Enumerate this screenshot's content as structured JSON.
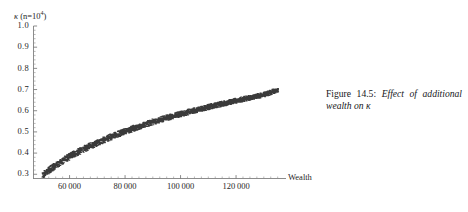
{
  "figure": {
    "caption_lead": "Figure 14.5:",
    "caption_body": "Effect of additional wealth on",
    "caption_symbol": "κ"
  },
  "axes": {
    "ylabel_symbol": "κ",
    "ylabel_prefix": " (n=10",
    "ylabel_exponent": "4",
    "ylabel_suffix": ")",
    "xlabel": "Wealth"
  },
  "chart_data": {
    "type": "scatter",
    "title": "",
    "subtitle": "",
    "xlabel": "Wealth",
    "ylabel": "κ (n=10⁴)",
    "xlim": [
      47000,
      138000
    ],
    "ylim": [
      0.28,
      1.0
    ],
    "grid": false,
    "legend": null,
    "xticks": [
      60000,
      80000,
      100000,
      120000
    ],
    "xtick_labels": [
      "60 000",
      "80 000",
      "100 000",
      "120 000"
    ],
    "yticks": [
      0.3,
      0.4,
      0.5,
      0.6,
      0.7,
      0.8,
      0.9,
      1.0
    ],
    "ytick_labels": [
      "0.3",
      "0.4",
      "0.5",
      "0.6",
      "0.7",
      "0.8",
      "0.9",
      "1.0"
    ],
    "minor_ticks": true,
    "marker_color": "#3a3a3a",
    "marker_size": 1.1,
    "point_count": 2600,
    "band_half_width": 0.016,
    "trend": {
      "x": [
        50000,
        55000,
        60000,
        65000,
        70000,
        75000,
        80000,
        85000,
        90000,
        95000,
        100000,
        105000,
        110000,
        115000,
        120000,
        125000,
        130000,
        135000
      ],
      "y": [
        0.295,
        0.345,
        0.385,
        0.42,
        0.45,
        0.478,
        0.503,
        0.527,
        0.548,
        0.567,
        0.585,
        0.602,
        0.618,
        0.633,
        0.648,
        0.662,
        0.676,
        0.7
      ]
    }
  }
}
